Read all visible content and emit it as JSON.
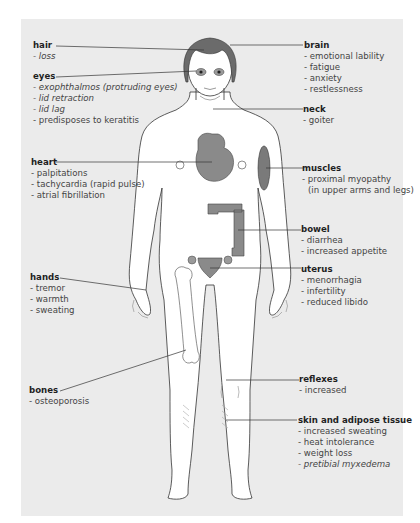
{
  "diagram": {
    "colors": {
      "panel": "#ebebeb",
      "organ": "#8a8a8a",
      "hair": "#6b6b6b",
      "line": "#333333",
      "skin": "#ffffff"
    },
    "labels": {
      "hair": {
        "title": "hair",
        "items": [
          "- loss"
        ]
      },
      "eyes": {
        "title": "eyes",
        "items": [
          "- exophthalmos (protruding eyes)",
          "- lid retraction",
          "- lid lag",
          "- predisposes to keratitis"
        ]
      },
      "heart": {
        "title": "heart",
        "items": [
          "- palpitations",
          "- tachycardia (rapid pulse)",
          "- atrial fibrillation"
        ]
      },
      "hands": {
        "title": "hands",
        "items": [
          "- tremor",
          "- warmth",
          "- sweating"
        ]
      },
      "bones": {
        "title": "bones",
        "items": [
          "- osteoporosis"
        ]
      },
      "brain": {
        "title": "brain",
        "items": [
          "- emotional lability",
          "- fatigue",
          "- anxiety",
          "- restlessness"
        ]
      },
      "neck": {
        "title": "neck",
        "items": [
          "- goiter"
        ]
      },
      "muscles": {
        "title": "muscles",
        "items": [
          "- proximal myopathy",
          "(in upper arms and legs)"
        ]
      },
      "bowel": {
        "title": "bowel",
        "items": [
          "- diarrhea",
          "- increased appetite"
        ]
      },
      "uterus": {
        "title": "uterus",
        "items": [
          "- menorrhagia",
          "- infertility",
          "- reduced  libido"
        ]
      },
      "reflexes": {
        "title": "reflexes",
        "items": [
          "- increased"
        ]
      },
      "skin": {
        "title": "skin and adipose tissue",
        "items": [
          "- increased sweating",
          "- heat intolerance",
          "- weight loss",
          "- pretibial myxedema"
        ]
      }
    }
  }
}
